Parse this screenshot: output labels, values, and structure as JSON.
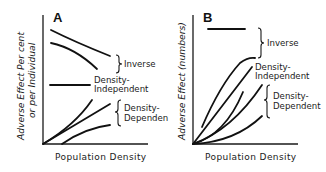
{
  "figure": {
    "panels": [
      {
        "id": "A",
        "label": "A",
        "y_axis_label_line1": "Adverse Effect Per cent",
        "y_axis_label_line2": "or per Individual",
        "x_axis_label": "Population Density",
        "groups": [
          {
            "name": "inverse",
            "label": "Inverse",
            "curve_count": 2,
            "trend": "decreasing"
          },
          {
            "name": "density-independent",
            "label_line1": "Density-",
            "label_line2": "Independent",
            "curve_count": 1,
            "trend": "flat"
          },
          {
            "name": "density-dependent",
            "label_line1": "Density-",
            "label_line2": "Dependen",
            "curve_count": 3,
            "trend": "increasing"
          }
        ]
      },
      {
        "id": "B",
        "label": "B",
        "y_axis_label": "Adverse Effect (numbers)",
        "x_axis_label": "Population Density",
        "groups": [
          {
            "name": "inverse",
            "label": "Inverse",
            "curve_count": 2,
            "trend": "flat / saturating"
          },
          {
            "name": "density-independent",
            "label_line1": "Density-",
            "label_line2": "Independent",
            "curve_count": 1,
            "trend": "linear increasing"
          },
          {
            "name": "density-dependent",
            "label_line1": "Density-",
            "label_line2": "Dependent",
            "curve_count": 3,
            "trend": "accelerating increasing"
          }
        ]
      }
    ]
  }
}
